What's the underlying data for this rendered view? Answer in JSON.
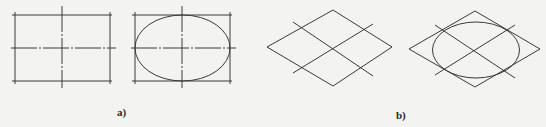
{
  "figure": {
    "colors": {
      "background": "#f3f3f1",
      "stroke": "#3a3a3a"
    },
    "panels": [
      {
        "id": "a",
        "label": "a)",
        "description": "Orthographic construction: rectangle with center lines, then inscribed ellipse",
        "shapes": [
          "rectangle-with-centerlines",
          "rectangle-with-inscribed-ellipse"
        ]
      },
      {
        "id": "b",
        "label": "b)",
        "description": "Isometric construction: rhombus with center lines, then inscribed ellipse",
        "shapes": [
          "rhombus-with-centerlines",
          "rhombus-with-inscribed-ellipse"
        ]
      }
    ]
  }
}
